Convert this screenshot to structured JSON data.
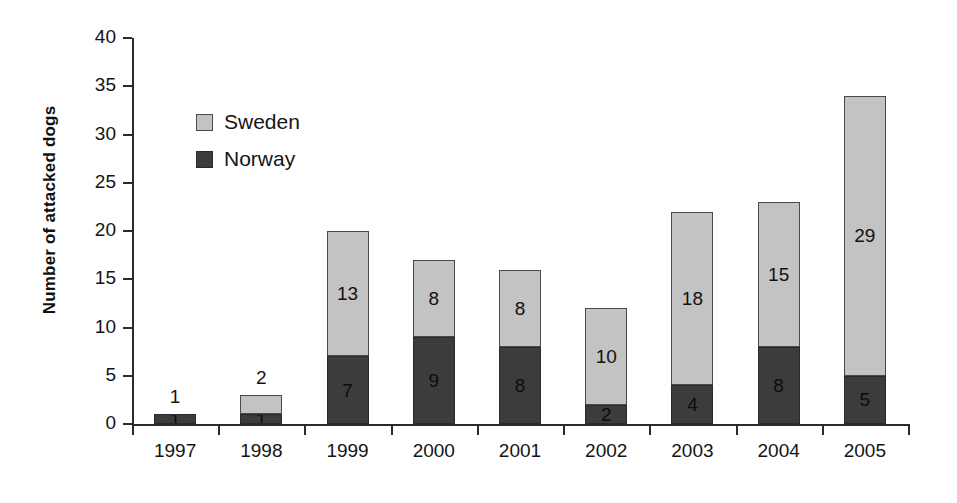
{
  "chart_data": {
    "type": "bar",
    "subtype": "stacked-bar",
    "title": "",
    "xlabel": "",
    "ylabel": "Number of attacked dogs",
    "categories": [
      "1997",
      "1998",
      "1999",
      "2000",
      "2001",
      "2002",
      "2003",
      "2004",
      "2005"
    ],
    "series": [
      {
        "name": "Norway",
        "color": "#3c3c3c",
        "values": [
          1,
          1,
          7,
          9,
          8,
          2,
          4,
          8,
          5
        ]
      },
      {
        "name": "Sweden",
        "color": "#c3c3c3",
        "values": [
          0,
          2,
          13,
          8,
          8,
          10,
          18,
          15,
          29
        ]
      }
    ],
    "bar_totals": [
      1,
      3,
      20,
      17,
      16,
      12,
      22,
      23,
      34
    ],
    "ylim": [
      0,
      40
    ],
    "ytick_values": [
      0,
      5,
      10,
      15,
      20,
      25,
      30,
      35,
      40
    ],
    "ytick_labels": [
      "0",
      "5",
      "10",
      "15",
      "20",
      "25",
      "30",
      "35",
      "40"
    ],
    "grid": false,
    "legend_position": "upper-left-inside",
    "legend_entries": [
      "Sweden",
      "Norway"
    ],
    "bar_value_labels": [
      {
        "category": "1997",
        "norway": "1",
        "sweden": "",
        "above_bar": "1"
      },
      {
        "category": "1998",
        "norway": "1",
        "sweden": "",
        "above_bar": "2"
      },
      {
        "category": "1999",
        "norway": "7",
        "sweden": "13",
        "above_bar": ""
      },
      {
        "category": "2000",
        "norway": "9",
        "sweden": "8",
        "above_bar": ""
      },
      {
        "category": "2001",
        "norway": "8",
        "sweden": "8",
        "above_bar": ""
      },
      {
        "category": "2002",
        "norway": "2",
        "sweden": "10",
        "above_bar": ""
      },
      {
        "category": "2003",
        "norway": "4",
        "sweden": "18",
        "above_bar": ""
      },
      {
        "category": "2004",
        "norway": "8",
        "sweden": "15",
        "above_bar": ""
      },
      {
        "category": "2005",
        "norway": "5",
        "sweden": "29",
        "above_bar": ""
      }
    ]
  },
  "axis": {
    "y_title": "Number of attacked dogs"
  },
  "legend": {
    "sweden_label": "Sweden",
    "norway_label": "Norway"
  }
}
